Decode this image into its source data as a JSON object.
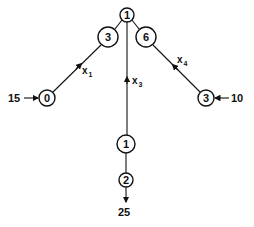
{
  "diagram": {
    "type": "network-flow",
    "colors": {
      "stroke": "#111111",
      "background": "#ffffff"
    },
    "nodes": [
      {
        "id": "top",
        "label": "1"
      },
      {
        "id": "upper_left",
        "label": "3"
      },
      {
        "id": "upper_right",
        "label": "6"
      },
      {
        "id": "left",
        "label": "0"
      },
      {
        "id": "right",
        "label": "3"
      },
      {
        "id": "lower_mid",
        "label": "1"
      },
      {
        "id": "bottom",
        "label": "2"
      }
    ],
    "external_flows": {
      "left_in": "15",
      "right_in": "10",
      "bottom_out": "25"
    },
    "variables": {
      "x1": {
        "base": "x",
        "sub": "1"
      },
      "x3": {
        "base": "x",
        "sub": "3"
      },
      "x4": {
        "base": "x",
        "sub": "4"
      }
    }
  }
}
